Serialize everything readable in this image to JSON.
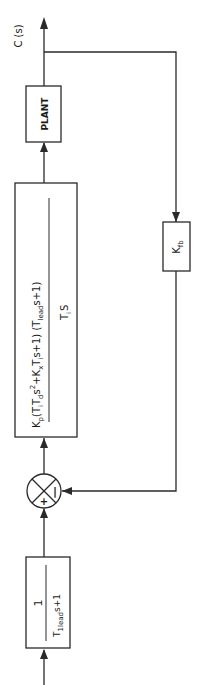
{
  "diagram": {
    "orientation": "rotated 90 degrees counterclockwise (signal flows bottom to top)",
    "output_label": "C (s)",
    "prefilter": {
      "numerator": "1",
      "denominator_T": "T",
      "denominator_sub": "lead",
      "denominator_T_sub1": "1",
      "denominator_rest": "s+1"
    },
    "summing_junction": {
      "plus_sign": "+",
      "minus_sign": "|"
    },
    "controller": {
      "numerator_parts": {
        "K": "K",
        "K_sub": "p",
        "open1": "(T",
        "Ti_sub": "i",
        "Td": "T",
        "Td_sub": "d",
        "s2": "s",
        "exp2": "2",
        "plus_K": "+K",
        "Kx_sub": "x",
        "T2": "T",
        "T2_sub": "i",
        "s_plus1_close": "s+1)",
        "open2": "(T",
        "lead_sub": "lead",
        "lead_s": "s",
        "plus1_close": "+1)"
      },
      "denominator": {
        "T": "T",
        "sub": "i",
        "s": "S"
      }
    },
    "plant": {
      "label": "PLANT"
    },
    "feedback": {
      "K": "K",
      "sub": "fb"
    },
    "colors": {
      "line": "#2a2a2a",
      "background": "#ffffff"
    }
  }
}
